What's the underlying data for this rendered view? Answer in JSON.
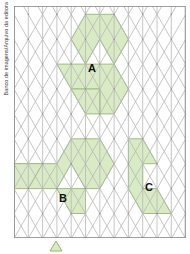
{
  "credit": {
    "text": "Banco de imagens/Arquivo da editora"
  },
  "figure": {
    "grid": {
      "type": "isometric-triangular",
      "columns": 12,
      "rows": 14,
      "cell_width": 14.3,
      "cell_height": 16.6,
      "line_color": "#b4b4b4",
      "heavy_line_color": "#9a9a9a",
      "border_color": "#9a9a9a",
      "background": "#ffffff"
    },
    "shape_fill": "#d9ebc4",
    "shape_stroke": "#9cc078",
    "shapes": [
      {
        "label": "A",
        "label_x": 92,
        "label_y": 66,
        "fill": "#d9ebc4",
        "outline": "#9cc078",
        "cells": 12,
        "description": "figura A na parte superior da malha"
      },
      {
        "label": "B",
        "label_x": 62,
        "label_y": 196,
        "fill": "#d9ebc4",
        "outline": "#9cc078",
        "cells": 12,
        "description": "figura B na parte inferior esquerda da malha"
      },
      {
        "label": "C",
        "label_x": 148,
        "label_y": 186,
        "fill": "#d9ebc4",
        "outline": "#9cc078",
        "cells": 8,
        "description": "figura C na parte inferior direita da malha"
      }
    ],
    "marker": {
      "name": "unit-triangle-marker",
      "fill": "#d9ebc4",
      "stroke": "#8fb76a"
    }
  }
}
